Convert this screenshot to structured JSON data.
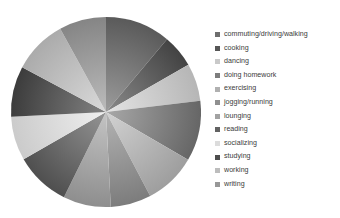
{
  "chart_data": {
    "type": "pie",
    "title": "",
    "legend_position": "right",
    "grid": false,
    "categories": [
      "commuting/driving/walking",
      "cooking",
      "dancing",
      "doing homework",
      "exercising",
      "jogging/running",
      "lounging",
      "reading",
      "socializing",
      "studying",
      "working",
      "writing"
    ],
    "values": [
      11.1,
      5.6,
      6.4,
      10.3,
      8.9,
      6.9,
      8.1,
      9.4,
      7.5,
      8.6,
      9.2,
      8.0
    ],
    "units": "percent",
    "start_angle_deg": 0,
    "direction": "clockwise",
    "colors": [
      "#6e6e6e",
      "#565656",
      "#c9c9c9",
      "#7d7d7d",
      "#b0b0b0",
      "#8f8f8f",
      "#a2a2a2",
      "#626262",
      "#dcdcdc",
      "#4e4e4e",
      "#bdbdbd",
      "#989898"
    ],
    "slice_gradients": [
      {
        "inner": "#9c9c9c",
        "outer": "#5a5a5a"
      },
      {
        "inner": "#8a8a8a",
        "outer": "#434343"
      },
      {
        "inner": "#e4e4e4",
        "outer": "#b6b6b6"
      },
      {
        "inner": "#a8a8a8",
        "outer": "#666666"
      },
      {
        "inner": "#d2d2d2",
        "outer": "#9e9e9e"
      },
      {
        "inner": "#b4b4b4",
        "outer": "#7c7c7c"
      },
      {
        "inner": "#c4c4c4",
        "outer": "#8e8e8e"
      },
      {
        "inner": "#949494",
        "outer": "#4f4f4f"
      },
      {
        "inner": "#efefef",
        "outer": "#cbcbcb"
      },
      {
        "inner": "#828282",
        "outer": "#3c3c3c"
      },
      {
        "inner": "#dadada",
        "outer": "#ababab"
      },
      {
        "inner": "#bcbcbc",
        "outer": "#858585"
      }
    ]
  },
  "legend": {
    "items": [
      {
        "label": "commuting/driving/walking",
        "swatch": "#6e6e6e"
      },
      {
        "label": "cooking",
        "swatch": "#565656"
      },
      {
        "label": "dancing",
        "swatch": "#c9c9c9"
      },
      {
        "label": "doing homework",
        "swatch": "#7d7d7d"
      },
      {
        "label": "exercising",
        "swatch": "#b0b0b0"
      },
      {
        "label": "jogging/running",
        "swatch": "#8f8f8f"
      },
      {
        "label": "lounging",
        "swatch": "#a2a2a2"
      },
      {
        "label": "reading",
        "swatch": "#626262"
      },
      {
        "label": "socializing",
        "swatch": "#dcdcdc"
      },
      {
        "label": "studying",
        "swatch": "#4e4e4e"
      },
      {
        "label": "working",
        "swatch": "#bdbdbd"
      },
      {
        "label": "writing",
        "swatch": "#989898"
      }
    ]
  },
  "canvas": {
    "background": "#ffffff",
    "pie_center_x": 99,
    "pie_center_y": 100,
    "pie_radius": 95
  }
}
